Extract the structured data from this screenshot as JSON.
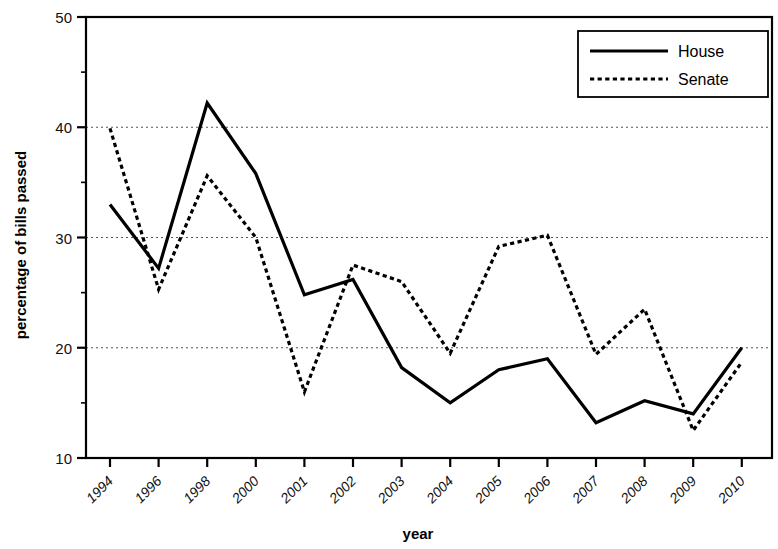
{
  "chart_data": {
    "type": "line",
    "title": "",
    "xlabel": "year",
    "ylabel": "percentage of bills passed",
    "categories": [
      "1994",
      "1996",
      "1998",
      "2000",
      "2001",
      "2002",
      "2003",
      "2004",
      "2005",
      "2006",
      "2007",
      "2008",
      "2009",
      "2010"
    ],
    "ylim": [
      10,
      50
    ],
    "ytick_values": [
      10,
      20,
      30,
      40,
      50
    ],
    "ytick_labels": [
      "10",
      "20",
      "30",
      "40",
      "50"
    ],
    "yminor_ticks": [
      15,
      25,
      35,
      45
    ],
    "grid": "horizontal-dotted",
    "legend_position": "top-right",
    "series": [
      {
        "name": "House",
        "style": "solid",
        "color": "#000000",
        "values": [
          33.0,
          27.2,
          42.2,
          35.8,
          24.8,
          26.2,
          18.2,
          15.0,
          18.0,
          19.0,
          13.2,
          15.2,
          14.0,
          20.0
        ]
      },
      {
        "name": "Senate",
        "style": "dotted",
        "color": "#000000",
        "values": [
          39.9,
          25.3,
          35.6,
          30.0,
          16.0,
          27.5,
          26.0,
          19.5,
          29.2,
          30.2,
          19.4,
          23.5,
          12.5,
          18.7
        ]
      }
    ]
  },
  "legend": {
    "entries": [
      {
        "label": "House",
        "style": "solid"
      },
      {
        "label": "Senate",
        "style": "dotted"
      }
    ]
  },
  "axes": {
    "x_title": "year",
    "y_title": "percentage of bills passed"
  }
}
